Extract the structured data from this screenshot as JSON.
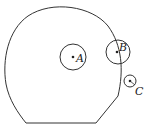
{
  "diagram": {
    "stroke_color": "#333333",
    "background": "#ffffff",
    "region": {
      "label": "",
      "shape": "rounded-dome-with-flat-bottom"
    },
    "points": [
      {
        "label": "A",
        "cx": 73,
        "cy": 57,
        "circle_r": 13
      },
      {
        "label": "B",
        "cx": 118,
        "cy": 52,
        "circle_r": 12
      },
      {
        "label": "C",
        "cx": 130,
        "cy": 81,
        "circle_r": 6
      }
    ]
  }
}
